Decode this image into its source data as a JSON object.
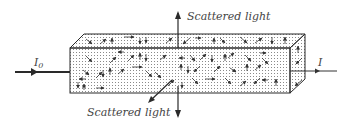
{
  "diagram": {
    "labels": {
      "scattered_top": "Scattered light",
      "scattered_bottom": "Scattered light",
      "incident": "I",
      "incident_sub": "0",
      "transmitted": "I"
    },
    "colors": {
      "stroke": "#2a2a2a",
      "text": "#444444",
      "dots": "#8a8a8a",
      "background": "#ffffff"
    },
    "box": {
      "front": {
        "x": 70,
        "y": 48,
        "w": 220,
        "h": 45
      },
      "depth_dx": 15,
      "depth_dy": -14
    }
  }
}
